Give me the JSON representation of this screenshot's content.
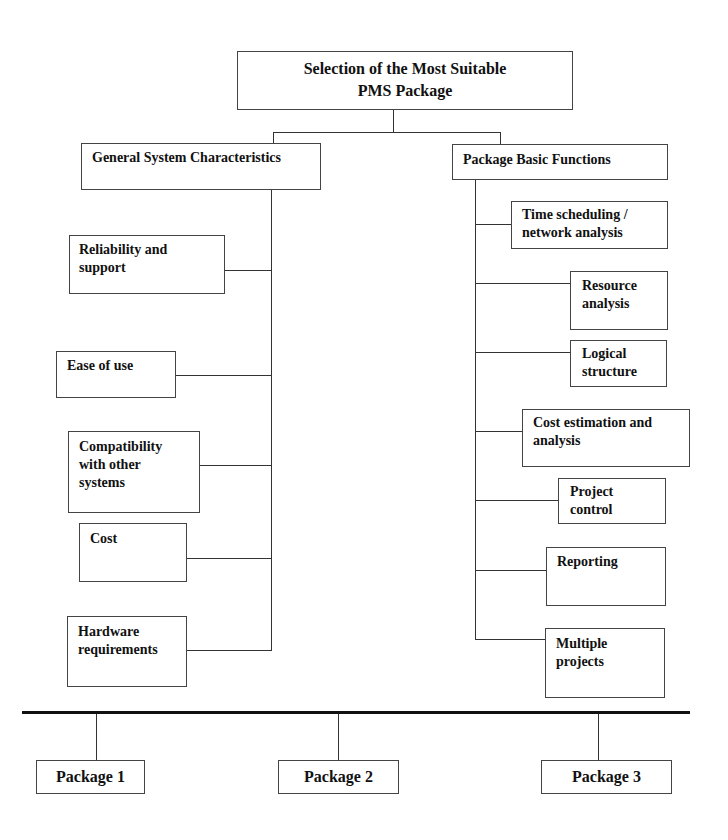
{
  "root": {
    "label": "Selection of the Most Suitable\nPMS Package"
  },
  "left_branch": {
    "label": "General System Characteristics",
    "items": [
      {
        "label": "Reliability and\nsupport"
      },
      {
        "label": "Ease of use"
      },
      {
        "label": "Compatibility\nwith other\nsystems"
      },
      {
        "label": "Cost"
      },
      {
        "label": "Hardware\nrequirements"
      }
    ]
  },
  "right_branch": {
    "label": "Package Basic Functions",
    "items": [
      {
        "label": "Time scheduling /\nnetwork analysis"
      },
      {
        "label": "Resource\nanalysis"
      },
      {
        "label": "Logical\nstructure"
      },
      {
        "label": "Cost estimation and\nanalysis"
      },
      {
        "label": "Project\ncontrol"
      },
      {
        "label": "Reporting"
      },
      {
        "label": "Multiple\nprojects"
      }
    ]
  },
  "packages": [
    {
      "label": "Package 1"
    },
    {
      "label": "Package 2"
    },
    {
      "label": "Package 3"
    }
  ]
}
